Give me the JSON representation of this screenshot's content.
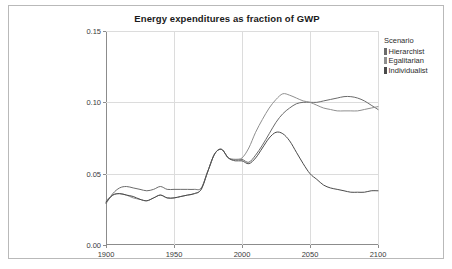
{
  "chart_data": {
    "type": "line",
    "title": "Energy expenditures as fraction of GWP",
    "xlabel": "",
    "ylabel": "",
    "xlim": [
      1900,
      2100
    ],
    "ylim": [
      0.0,
      0.15
    ],
    "grid": true,
    "xticks": [
      "1900",
      "1950",
      "2000",
      "2050",
      "2100"
    ],
    "xtick_values": [
      1900,
      1950,
      2000,
      2050,
      2100
    ],
    "yticks": [
      "0.00",
      "0.05",
      "0.10",
      "0.15"
    ],
    "ytick_values": [
      0.0,
      0.05,
      0.1,
      0.15
    ],
    "legend_title": "Scenario",
    "legend_position": "right-top",
    "x": [
      1900,
      1905,
      1910,
      1915,
      1920,
      1925,
      1930,
      1935,
      1940,
      1945,
      1950,
      1955,
      1960,
      1965,
      1970,
      1975,
      1980,
      1985,
      1990,
      1995,
      2000,
      2005,
      2010,
      2015,
      2020,
      2025,
      2030,
      2035,
      2040,
      2045,
      2050,
      2055,
      2060,
      2065,
      2070,
      2075,
      2080,
      2085,
      2090,
      2095,
      2100
    ],
    "series": [
      {
        "name": "Hierarchist",
        "color": "#6b6b6b",
        "values": [
          0.029,
          0.036,
          0.04,
          0.041,
          0.04,
          0.039,
          0.038,
          0.039,
          0.041,
          0.039,
          0.039,
          0.039,
          0.039,
          0.039,
          0.04,
          0.052,
          0.064,
          0.067,
          0.061,
          0.06,
          0.06,
          0.058,
          0.063,
          0.07,
          0.078,
          0.086,
          0.092,
          0.096,
          0.099,
          0.1,
          0.1,
          0.1,
          0.101,
          0.102,
          0.103,
          0.104,
          0.104,
          0.103,
          0.101,
          0.098,
          0.095
        ]
      },
      {
        "name": "Egalitarian",
        "color": "#8f8f8f",
        "values": [
          0.031,
          0.035,
          0.036,
          0.035,
          0.033,
          0.032,
          0.031,
          0.033,
          0.035,
          0.033,
          0.033,
          0.034,
          0.035,
          0.036,
          0.039,
          0.052,
          0.064,
          0.067,
          0.061,
          0.06,
          0.061,
          0.068,
          0.079,
          0.088,
          0.096,
          0.102,
          0.106,
          0.105,
          0.103,
          0.101,
          0.1,
          0.098,
          0.096,
          0.095,
          0.094,
          0.094,
          0.094,
          0.094,
          0.095,
          0.096,
          0.097
        ]
      },
      {
        "name": "Individualist",
        "color": "#4a4a4a",
        "values": [
          0.03,
          0.035,
          0.036,
          0.035,
          0.034,
          0.032,
          0.031,
          0.033,
          0.035,
          0.033,
          0.033,
          0.034,
          0.035,
          0.036,
          0.039,
          0.052,
          0.064,
          0.067,
          0.061,
          0.059,
          0.059,
          0.057,
          0.061,
          0.068,
          0.075,
          0.079,
          0.078,
          0.073,
          0.065,
          0.057,
          0.05,
          0.046,
          0.042,
          0.04,
          0.039,
          0.038,
          0.037,
          0.037,
          0.037,
          0.038,
          0.038
        ]
      }
    ]
  },
  "legend": {
    "title": "Scenario",
    "items": [
      {
        "label": "Hierarchist",
        "color": "#6b6b6b"
      },
      {
        "label": "Egalitarian",
        "color": "#8f8f8f"
      },
      {
        "label": "Individualist",
        "color": "#4a4a4a"
      }
    ]
  }
}
